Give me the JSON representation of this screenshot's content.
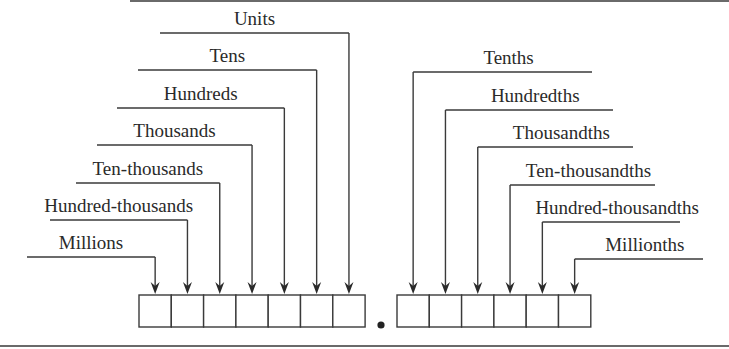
{
  "diagram": {
    "integer_places": [
      {
        "label": "Units"
      },
      {
        "label": "Tens"
      },
      {
        "label": "Hundreds"
      },
      {
        "label": "Thousands"
      },
      {
        "label": "Ten-thousands"
      },
      {
        "label": "Hundred-thousands"
      },
      {
        "label": "Millions"
      }
    ],
    "decimal_point": "•",
    "decimal_places": [
      {
        "label": "Tenths"
      },
      {
        "label": "Hundredths"
      },
      {
        "label": "Thousandths"
      },
      {
        "label": "Ten-thousandths"
      },
      {
        "label": "Hundred-thousandths"
      },
      {
        "label": "Millionths"
      }
    ],
    "colors": {
      "line": "#3a3a3a",
      "text": "#2a2a2a",
      "background": "#ffffff"
    }
  }
}
